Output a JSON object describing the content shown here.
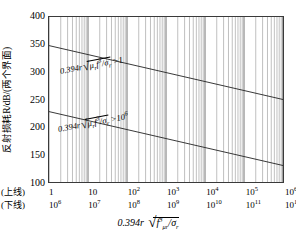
{
  "chart_data": {
    "type": "line",
    "title": "",
    "ylabel": "反射损耗R/dB/(两个界面)",
    "xlabel": "0.394r √(f³μᵣ/σᵣ)",
    "xlabel_parts": {
      "coef": "0.394r",
      "radical": "√",
      "numerator": "f",
      "num_exp": "3",
      "mu": "μ",
      "mu_sub": "r",
      "slash": "/",
      "sigma": "σ",
      "sigma_sub": "r"
    },
    "ylim": [
      100,
      400
    ],
    "yticks": [
      400,
      350,
      300,
      250,
      200,
      150,
      100
    ],
    "ytick_labels": [
      "400",
      "350",
      "300",
      "250",
      "200",
      "150",
      "100"
    ],
    "xscale": "log",
    "grid": "log-minor-vertical",
    "x_axis_rows": [
      {
        "row_label": "(上线)",
        "ticks": [
          {
            "label": "1",
            "base": "1",
            "exp": ""
          },
          {
            "label": "10",
            "base": "10",
            "exp": ""
          },
          {
            "label": "10^2",
            "base": "10",
            "exp": "2"
          },
          {
            "label": "10^3",
            "base": "10",
            "exp": "3"
          },
          {
            "label": "10^4",
            "base": "10",
            "exp": "4"
          },
          {
            "label": "10^5",
            "base": "10",
            "exp": "5"
          },
          {
            "label": "10^6",
            "base": "10",
            "exp": "6"
          }
        ]
      },
      {
        "row_label": "(下线)",
        "ticks": [
          {
            "label": "10^6",
            "base": "10",
            "exp": "6"
          },
          {
            "label": "10^7",
            "base": "10",
            "exp": "7"
          },
          {
            "label": "10^8",
            "base": "10",
            "exp": "8"
          },
          {
            "label": "10^9",
            "base": "10",
            "exp": "9"
          },
          {
            "label": "10^10",
            "base": "10",
            "exp": "10"
          },
          {
            "label": "10^11",
            "base": "10",
            "exp": "11"
          },
          {
            "label": "10^12",
            "base": "10",
            "exp": "12"
          }
        ]
      }
    ],
    "series": [
      {
        "name": "upper-line",
        "annotation": "0.394r √(μᵣf³/σᵣ) > 1",
        "annotation_parts": {
          "coef": "0.394r",
          "mu": "μ",
          "mu_sub": "r",
          "f": "f",
          "f_exp": "3",
          "sigma": "σ",
          "sigma_sub": "r",
          "rel": ">",
          "rhs": "1",
          "rhs_exp": ""
        },
        "x": [
          1,
          1000000
        ],
        "y": [
          348,
          250
        ]
      },
      {
        "name": "lower-line",
        "annotation": "0.394r √(μᵣf³/σᵣ) > 10⁶",
        "annotation_parts": {
          "coef": "0.394r",
          "mu": "μ",
          "mu_sub": "r",
          "f": "f",
          "f_exp": "3",
          "sigma": "σ",
          "sigma_sub": "r",
          "rel": ">",
          "rhs": "10",
          "rhs_exp": "6"
        },
        "x": [
          1,
          1000000
        ],
        "y": [
          228,
          130
        ]
      }
    ],
    "line_color": "#222222",
    "grid_color": "#8a8a8a",
    "axis_color": "#3a3a3a"
  }
}
